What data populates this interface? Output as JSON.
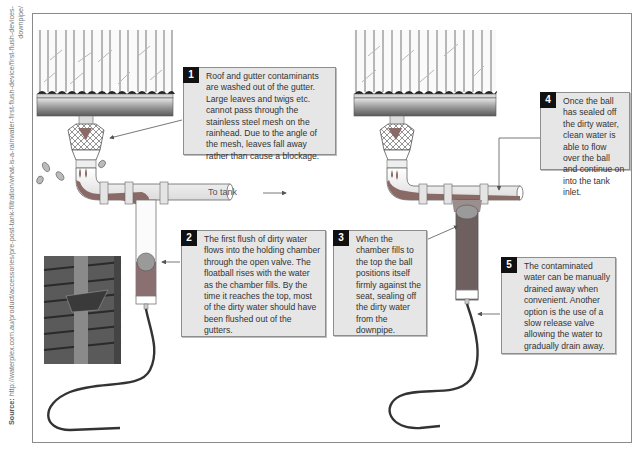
{
  "source": {
    "label": "Source:",
    "text": " http://waterplex.com.au/product/accessories/pre-post-tank-filtration/what-is-a-rainwater-first-flush-device/first-flush-devices-downpipe/"
  },
  "labels": {
    "to_tank": "To tank"
  },
  "callouts": [
    {
      "number": "1",
      "text": "Roof and gutter contaminants are washed out of the gutter. Large leaves and twigs etc. cannot pass through the stainless steel mesh on the rainhead. Due to the angle of the mesh, leaves fall away rather than cause a blockage."
    },
    {
      "number": "2",
      "text": "The first flush of dirty water flows into the holding chamber through the open valve. The floatball rises with the water as the chamber fills. By the time it reaches the top, most of the dirty water should have been flushed out of the gutters."
    },
    {
      "number": "3",
      "text": "When the chamber fills to the top the ball positions itself firmly against the seat, sealing off the dirty water from the downpipe."
    },
    {
      "number": "4",
      "text": "Once the ball has sealed off the dirty water, clean water is able to flow over the ball and continue on into the tank inlet."
    },
    {
      "number": "5",
      "text": "The contaminated water can be manually drained away when convenient. Another option is the use of a slow release valve allowing the water to gradually drain away."
    }
  ],
  "colors": {
    "callout_bg": "#e6e6e6",
    "number_badge": "#111111",
    "dirty_water": "#8a6a66",
    "pipe": "#f4f4f4",
    "hose": "#3a3a3a"
  }
}
